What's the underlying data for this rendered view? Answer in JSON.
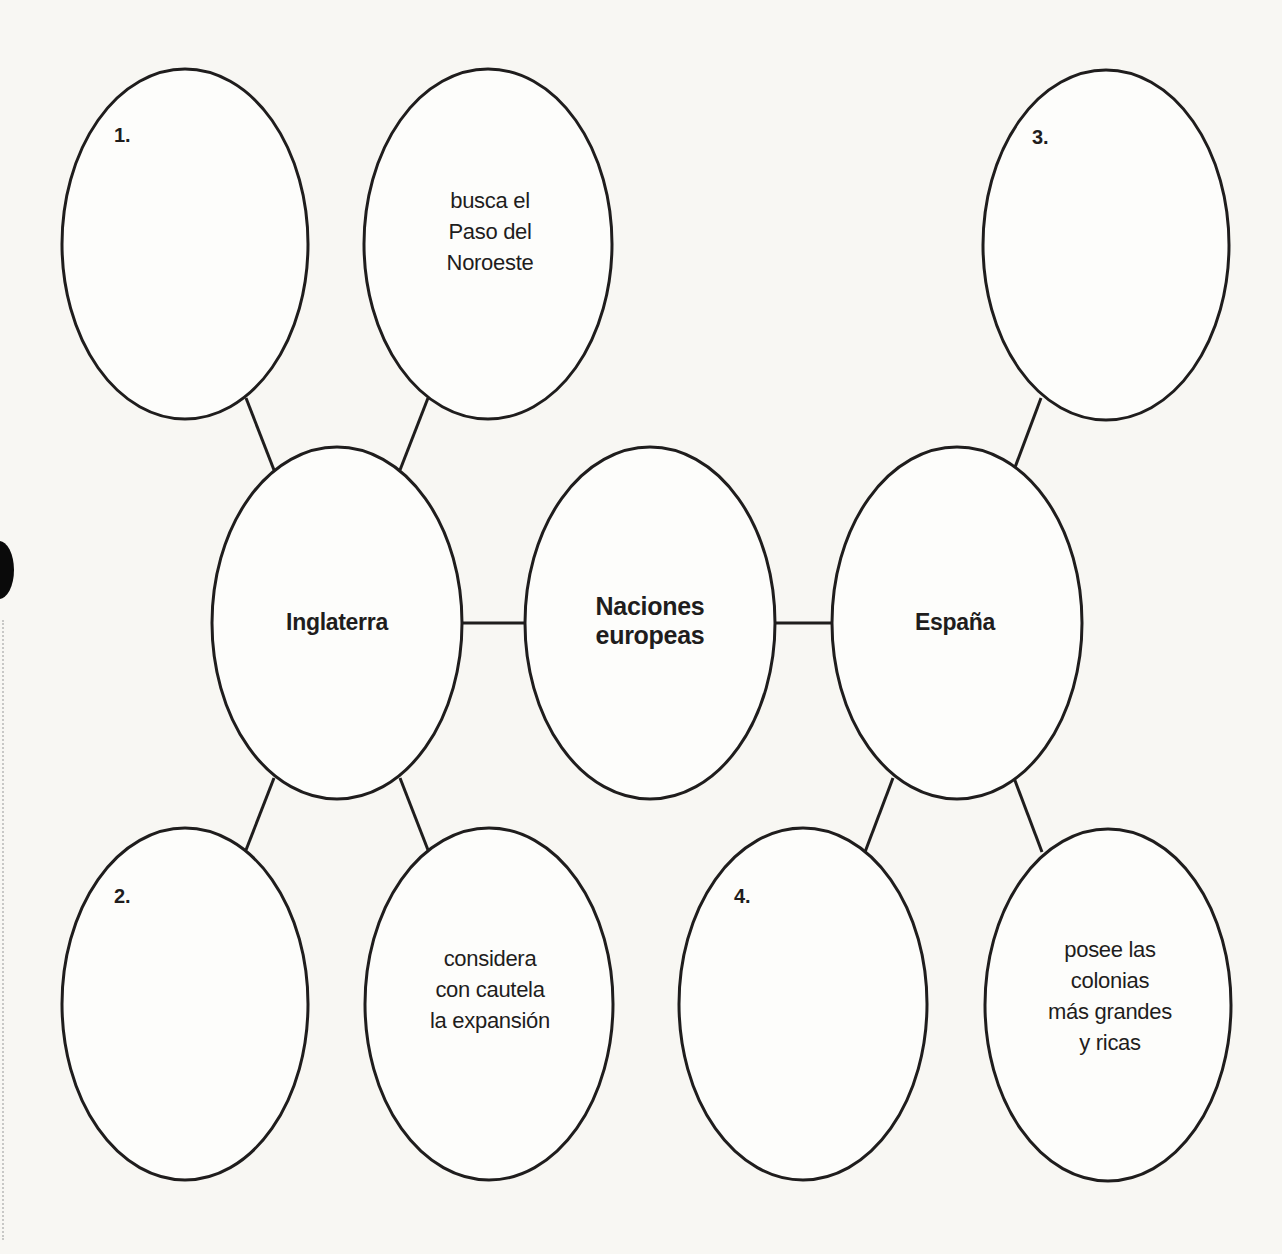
{
  "diagram": {
    "title": "Naciones europeas",
    "center": {
      "line1": "Naciones",
      "line2": "europeas"
    },
    "england": {
      "label": "Inglaterra",
      "blank_top": {
        "number": "1."
      },
      "fact_top": {
        "line1": "busca el",
        "line2": "Paso del",
        "line3": "Noroeste"
      },
      "blank_bottom": {
        "number": "2."
      },
      "fact_bottom": {
        "line1": "considera",
        "line2": "con cautela",
        "line3": "la expansión"
      }
    },
    "spain": {
      "label": "España",
      "blank_top": {
        "number": "3."
      },
      "blank_bottom": {
        "number": "4."
      },
      "fact_bottom": {
        "line1": "posee las",
        "line2": "colonias",
        "line3": "más grandes",
        "line4": "y ricas"
      }
    }
  },
  "colors": {
    "ink": "#1f1d1d",
    "paper": "#f8f7f3"
  }
}
